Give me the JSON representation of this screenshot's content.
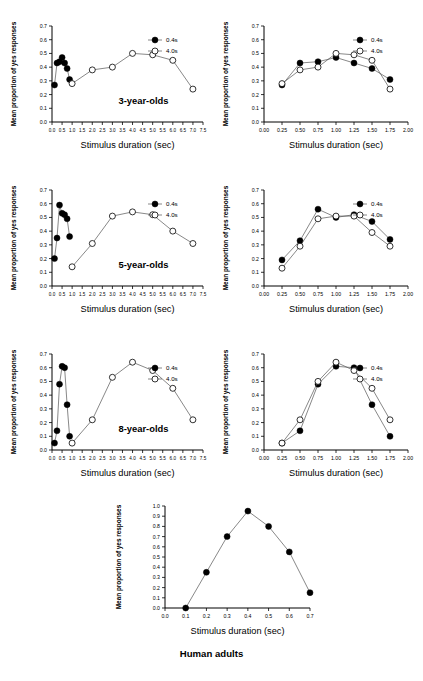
{
  "figure": {
    "caption": "Human adults",
    "axis_labels": {
      "x": "Stimulus duration (sec)",
      "y": "Mean proportion of yes responses"
    },
    "legend": {
      "filled": "0.4s",
      "open": "4.0s"
    },
    "group_labels": {
      "three": "3-year-olds",
      "five": "5-year-olds",
      "eight": "8-year-olds"
    },
    "colors": {
      "marker_filled": "#000000",
      "marker_open": "#ffffff",
      "line": "#555555",
      "axis": "#000000"
    }
  },
  "ticks": {
    "y_07": [
      "0.0",
      "0.1",
      "0.2",
      "0.3",
      "0.4",
      "0.5",
      "0.6",
      "0.7"
    ],
    "y_10": [
      "0.0",
      "0.1",
      "0.2",
      "0.3",
      "0.4",
      "0.5",
      "0.6",
      "0.7",
      "0.8",
      "0.9",
      "1.0"
    ],
    "x_wide": [
      "0.0",
      "0.5",
      "1.0",
      "1.5",
      "2.0",
      "2.5",
      "3.0",
      "3.5",
      "4.0",
      "4.5",
      "5.0",
      "5.5",
      "6.0",
      "6.5",
      "7.0",
      "7.5"
    ],
    "x_fine": [
      "0.00",
      "0.25",
      "0.50",
      "0.75",
      "1.00",
      "1.25",
      "1.50",
      "1.75",
      "2.00"
    ],
    "x_adult": [
      "0.0",
      "0.1",
      "0.2",
      "0.3",
      "0.4",
      "0.5",
      "0.6",
      "0.7"
    ]
  },
  "chart_data": [
    {
      "type": "line",
      "panel": "3-year-olds-wide",
      "title": "3-year-olds",
      "xlabel": "Stimulus duration (sec)",
      "ylabel": "Mean proportion of yes responses",
      "xlim": [
        0.0,
        7.5
      ],
      "ylim": [
        0.0,
        0.7
      ],
      "grid": false,
      "legend_position": "top-right",
      "series": [
        {
          "name": "0.4s",
          "marker": "filled",
          "x": [
            0.125,
            0.25,
            0.375,
            0.5,
            0.625,
            0.75,
            0.875
          ],
          "y": [
            0.27,
            0.43,
            0.44,
            0.47,
            0.43,
            0.39,
            0.31
          ]
        },
        {
          "name": "4.0s",
          "marker": "open",
          "x": [
            1.0,
            2.0,
            3.0,
            4.0,
            5.0,
            6.0,
            7.0
          ],
          "y": [
            0.28,
            0.38,
            0.4,
            0.5,
            0.49,
            0.45,
            0.24
          ]
        }
      ]
    },
    {
      "type": "line",
      "panel": "3-year-olds-fine",
      "title": "",
      "xlabel": "Stimulus duration (sec)",
      "ylabel": "Mean proportion of yes responses",
      "xlim": [
        0.0,
        2.0
      ],
      "ylim": [
        0.0,
        0.7
      ],
      "grid": false,
      "legend_position": "top-right",
      "series": [
        {
          "name": "0.4s",
          "marker": "filled",
          "x": [
            0.25,
            0.5,
            0.75,
            1.0,
            1.25,
            1.5,
            1.75
          ],
          "y": [
            0.27,
            0.43,
            0.44,
            0.47,
            0.43,
            0.39,
            0.31
          ]
        },
        {
          "name": "4.0s",
          "marker": "open",
          "x": [
            0.25,
            0.5,
            0.75,
            1.0,
            1.25,
            1.5,
            1.75
          ],
          "y": [
            0.28,
            0.38,
            0.4,
            0.5,
            0.49,
            0.45,
            0.24
          ]
        }
      ]
    },
    {
      "type": "line",
      "panel": "5-year-olds-wide",
      "title": "5-year-olds",
      "xlabel": "Stimulus duration (sec)",
      "ylabel": "Mean proportion of yes responses",
      "xlim": [
        0.0,
        7.5
      ],
      "ylim": [
        0.0,
        0.7
      ],
      "grid": false,
      "legend_position": "top-right",
      "series": [
        {
          "name": "0.4s",
          "marker": "filled",
          "x": [
            0.125,
            0.25,
            0.375,
            0.5,
            0.625,
            0.75,
            0.875
          ],
          "y": [
            0.2,
            0.35,
            0.59,
            0.53,
            0.52,
            0.49,
            0.36
          ]
        },
        {
          "name": "4.0s",
          "marker": "open",
          "x": [
            1.0,
            2.0,
            3.0,
            4.0,
            5.0,
            6.0,
            7.0
          ],
          "y": [
            0.14,
            0.31,
            0.51,
            0.54,
            0.52,
            0.4,
            0.31
          ]
        }
      ]
    },
    {
      "type": "line",
      "panel": "5-year-olds-fine",
      "title": "",
      "xlabel": "Stimulus duration (sec)",
      "ylabel": "Mean proportion of yes responses",
      "xlim": [
        0.0,
        2.0
      ],
      "ylim": [
        0.0,
        0.7
      ],
      "grid": false,
      "legend_position": "top-right",
      "series": [
        {
          "name": "0.4s",
          "marker": "filled",
          "x": [
            0.25,
            0.5,
            0.75,
            1.0,
            1.25,
            1.5,
            1.75
          ],
          "y": [
            0.19,
            0.33,
            0.56,
            0.5,
            0.52,
            0.47,
            0.34
          ]
        },
        {
          "name": "4.0s",
          "marker": "open",
          "x": [
            0.25,
            0.5,
            0.75,
            1.0,
            1.25,
            1.5,
            1.75
          ],
          "y": [
            0.13,
            0.29,
            0.49,
            0.51,
            0.51,
            0.39,
            0.29
          ]
        }
      ]
    },
    {
      "type": "line",
      "panel": "8-year-olds-wide",
      "title": "8-year-olds",
      "xlabel": "Stimulus duration (sec)",
      "ylabel": "Mean proportion of yes responses",
      "xlim": [
        0.0,
        7.5
      ],
      "ylim": [
        0.0,
        0.7
      ],
      "grid": false,
      "legend_position": "top-right",
      "series": [
        {
          "name": "0.4s",
          "marker": "filled",
          "x": [
            0.125,
            0.25,
            0.375,
            0.5,
            0.625,
            0.75,
            0.875
          ],
          "y": [
            0.05,
            0.14,
            0.48,
            0.61,
            0.6,
            0.33,
            0.1
          ]
        },
        {
          "name": "4.0s",
          "marker": "open",
          "x": [
            1.0,
            2.0,
            3.0,
            4.0,
            5.0,
            6.0,
            7.0
          ],
          "y": [
            0.05,
            0.22,
            0.53,
            0.64,
            0.58,
            0.45,
            0.22
          ]
        }
      ]
    },
    {
      "type": "line",
      "panel": "8-year-olds-fine",
      "title": "",
      "xlabel": "Stimulus duration (sec)",
      "ylabel": "Mean proportion of yes responses",
      "xlim": [
        0.0,
        2.0
      ],
      "ylim": [
        0.0,
        0.7
      ],
      "grid": false,
      "legend_position": "top-right",
      "series": [
        {
          "name": "0.4s",
          "marker": "filled",
          "x": [
            0.25,
            0.5,
            0.75,
            1.0,
            1.25,
            1.5,
            1.75
          ],
          "y": [
            0.05,
            0.14,
            0.48,
            0.61,
            0.6,
            0.33,
            0.1
          ]
        },
        {
          "name": "4.0s",
          "marker": "open",
          "x": [
            0.25,
            0.5,
            0.75,
            1.0,
            1.25,
            1.5,
            1.75
          ],
          "y": [
            0.05,
            0.22,
            0.5,
            0.64,
            0.58,
            0.45,
            0.22
          ]
        }
      ]
    },
    {
      "type": "line",
      "panel": "human-adults",
      "title": "Human adults",
      "xlabel": "Stimulus duration (sec)",
      "ylabel": "Mean proportion of yes responses",
      "xlim": [
        0.0,
        0.7
      ],
      "ylim": [
        0.0,
        1.0
      ],
      "grid": false,
      "legend_position": "none",
      "series": [
        {
          "name": "adults",
          "marker": "filled",
          "x": [
            0.1,
            0.2,
            0.3,
            0.4,
            0.5,
            0.6,
            0.7
          ],
          "y": [
            0.0,
            0.35,
            0.7,
            0.95,
            0.8,
            0.55,
            0.15
          ]
        }
      ]
    }
  ]
}
